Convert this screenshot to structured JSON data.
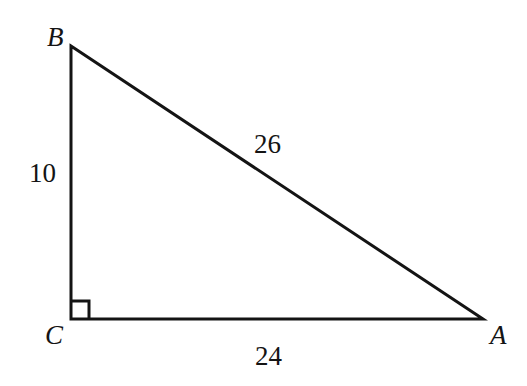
{
  "figure": {
    "kind": "right-triangle-diagram",
    "background_color": "#ffffff",
    "stroke_color": "#141414",
    "stroke_width": 3,
    "canvas": {
      "width": 527,
      "height": 386
    },
    "vertices": [
      {
        "name": "B",
        "label": "B",
        "x": 71,
        "y": 46
      },
      {
        "name": "C",
        "label": "C",
        "x": 71,
        "y": 319
      },
      {
        "name": "A",
        "label": "A",
        "x": 483,
        "y": 319
      }
    ],
    "right_angle": {
      "at_vertex": "C",
      "marker": "square",
      "size": 18,
      "symbol": "right-angle-square"
    },
    "sides": [
      {
        "name": "BC",
        "from": "B",
        "to": "C",
        "length_label": "10",
        "role": "leg"
      },
      {
        "name": "CA",
        "from": "C",
        "to": "A",
        "length_label": "24",
        "role": "leg"
      },
      {
        "name": "AB",
        "from": "A",
        "to": "B",
        "length_label": "26",
        "role": "hypotenuse"
      }
    ]
  }
}
